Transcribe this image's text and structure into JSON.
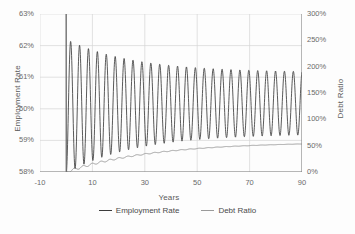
{
  "chart_data": {
    "type": "line",
    "title": "",
    "xlabel": "Years",
    "ylabel": "Employment Rate",
    "y2label": "Debt Ratio",
    "xlim": [
      -10,
      90
    ],
    "ylim": [
      58,
      63
    ],
    "y2lim": [
      0,
      300
    ],
    "grid": true,
    "legend_position": "bottom",
    "xticks": [
      "-10",
      "10",
      "30",
      "50",
      "70",
      "90"
    ],
    "xtick_values": [
      -10,
      10,
      30,
      50,
      70,
      90
    ],
    "yticks_left": [
      "58%",
      "59%",
      "60%",
      "61%",
      "62%",
      "63%"
    ],
    "ytick_values_left": [
      58,
      59,
      60,
      61,
      62,
      63
    ],
    "yticks_right": [
      "0%",
      "50%",
      "100%",
      "150%",
      "200%",
      "250%",
      "300%"
    ],
    "ytick_values_right": [
      0,
      50,
      100,
      150,
      200,
      250,
      300
    ],
    "series": [
      {
        "name": "Employment Rate",
        "axis": "left",
        "color": "#3c3c3c",
        "description": "Damped oscillation beginning at year 0 with a sharp drop from 63% to 58%, then cycling with a period of about 3.4 years; envelope decays from roughly 58.0%-62.2% early to 59.2%-61.1% at year 90, with mean drifting from about 60.1% toward 60.2%.",
        "x": [
          0,
          1.7,
          3.4,
          5.1,
          6.8,
          8.5,
          10.2,
          11.9,
          13.6,
          15.3,
          17,
          18.7,
          20.4,
          22.1,
          23.8,
          25.5,
          27.2,
          28.9,
          30.6,
          32.3,
          34,
          35.7,
          37.4,
          39.1,
          40.8,
          42.5,
          44.2,
          45.9,
          47.6,
          49.3,
          51,
          52.7,
          54.4,
          56.1,
          57.8,
          59.5,
          61.2,
          62.9,
          64.6,
          66.3,
          68,
          69.7,
          71.4,
          73.1,
          74.8,
          76.5,
          78.2,
          79.9,
          81.6,
          83.3,
          85,
          86.7,
          88.4,
          90
        ],
        "y": [
          63.0,
          58.02,
          62.21,
          58.1,
          62.08,
          58.2,
          61.98,
          58.3,
          61.86,
          58.4,
          61.78,
          58.48,
          61.7,
          58.55,
          61.64,
          58.62,
          61.58,
          58.68,
          61.52,
          58.74,
          61.47,
          58.79,
          61.43,
          58.84,
          61.4,
          58.88,
          61.36,
          58.92,
          61.33,
          58.96,
          61.3,
          58.99,
          61.28,
          59.02,
          61.26,
          59.05,
          61.24,
          59.07,
          61.22,
          59.09,
          61.2,
          59.11,
          61.19,
          59.13,
          61.18,
          59.14,
          61.17,
          59.16,
          61.16,
          59.17,
          61.15,
          59.18,
          61.14,
          59.6
        ]
      },
      {
        "name": "Debt Ratio",
        "axis": "right",
        "color": "#9a9a9a",
        "description": "Rises from about 0% at year 0 to roughly 55% at year 90, following a concave saturating curve with small ripples matching the employment cycle; ripples are largest in the first 25 years and nearly flat after year 70.",
        "x": [
          0,
          2,
          4,
          6,
          8,
          10,
          12,
          14,
          16,
          18,
          20,
          22,
          24,
          26,
          28,
          30,
          32,
          34,
          36,
          38,
          40,
          42,
          44,
          46,
          48,
          50,
          52,
          54,
          56,
          58,
          60,
          62,
          64,
          66,
          68,
          70,
          72,
          74,
          76,
          78,
          80,
          82,
          84,
          86,
          88,
          90
        ],
        "y": [
          0,
          2,
          5,
          4,
          9,
          8,
          13,
          12,
          17,
          16,
          20,
          21,
          24,
          25,
          28,
          28,
          31,
          32,
          34,
          35,
          37,
          38,
          40,
          40,
          42,
          43,
          44,
          45,
          46,
          46,
          47,
          48,
          49,
          49,
          50,
          50,
          51,
          51,
          52,
          52,
          53,
          53,
          54,
          54,
          55,
          55
        ]
      }
    ],
    "colors": {
      "employment_rate": "#3c3c3c",
      "debt_ratio": "#9a9a9a",
      "grid": "#d6d6d6",
      "axis": "#8a8a8a",
      "text": "#5a5a5a",
      "background": "#fdfdfd"
    }
  },
  "legend": {
    "items": [
      {
        "label": "Employment Rate",
        "color": "#3c3c3c"
      },
      {
        "label": "Debt Ratio",
        "color": "#9a9a9a"
      }
    ]
  }
}
